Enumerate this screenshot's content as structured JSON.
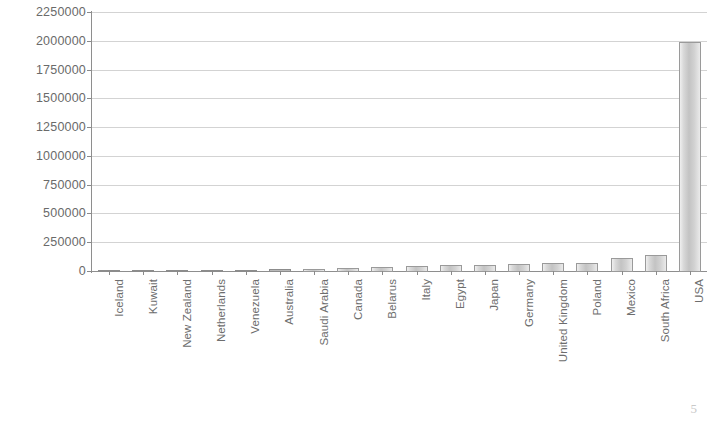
{
  "page": {
    "page_number": "5"
  },
  "chart_data": {
    "type": "bar",
    "title": "",
    "subtitle": "",
    "xlabel": "",
    "ylabel": "",
    "grid": true,
    "legend": false,
    "ylim": [
      0,
      2250000
    ],
    "ytick_step": 250000,
    "ytick_labels": [
      "2250000",
      "2000000",
      "1750000",
      "1500000",
      "1250000",
      "1000000",
      "750000",
      "500000",
      "250000",
      "0"
    ],
    "ytick_values": [
      2250000,
      2000000,
      1750000,
      1500000,
      1250000,
      1000000,
      750000,
      500000,
      250000,
      0
    ],
    "categories": [
      "Iceland",
      "Kuwait",
      "New Zealand",
      "Netherlands",
      "Venezuela",
      "Australia",
      "Saudi Arabia",
      "Canada",
      "Belarus",
      "Italy",
      "Egypt",
      "Japan",
      "Germany",
      "United Kingdom",
      "Poland",
      "Mexico",
      "South Africa",
      "USA"
    ],
    "values": [
      1500,
      3500,
      8000,
      9500,
      18000,
      26000,
      30000,
      36000,
      44000,
      55000,
      62000,
      64000,
      68000,
      74000,
      80000,
      120000,
      150000,
      2000000
    ],
    "bar_color": "#cfcfcf",
    "bar_edge_color": "#9a9a9a",
    "grid_color": "#d3d3d3",
    "axis_color": "#8e8e8e",
    "text_color": "#6d6d6d"
  }
}
